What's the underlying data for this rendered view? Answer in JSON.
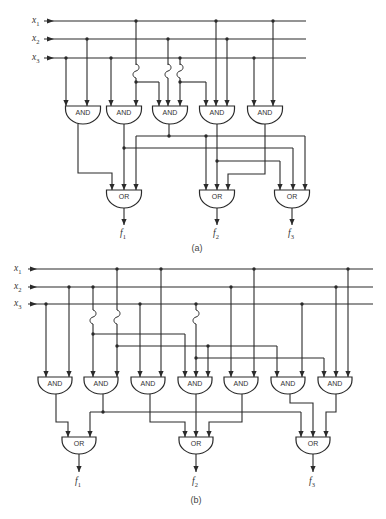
{
  "figure": {
    "panels": [
      {
        "id": "a",
        "caption": "(a)",
        "inputs": [
          {
            "name": "x",
            "sub": "1"
          },
          {
            "name": "x",
            "sub": "2"
          },
          {
            "name": "x",
            "sub": "3"
          }
        ],
        "and_gates": [
          {
            "label": "AND",
            "inputs": [
              "x3",
              "x2"
            ]
          },
          {
            "label": "AND",
            "inputs": [
              "x3",
              "x1"
            ]
          },
          {
            "label": "AND",
            "inputs": [
              "x1",
              "x2",
              "x3"
            ]
          },
          {
            "label": "AND",
            "inputs": [
              "x3",
              "x1",
              "x2"
            ]
          },
          {
            "label": "AND",
            "inputs": [
              "x3",
              "x1"
            ]
          }
        ],
        "or_gates": [
          {
            "label": "OR",
            "output": {
              "name": "f",
              "sub": "1"
            }
          },
          {
            "label": "OR",
            "output": {
              "name": "f",
              "sub": "2"
            }
          },
          {
            "label": "OR",
            "output": {
              "name": "f",
              "sub": "3"
            }
          }
        ]
      },
      {
        "id": "b",
        "caption": "(b)",
        "inputs": [
          {
            "name": "x",
            "sub": "1"
          },
          {
            "name": "x",
            "sub": "2"
          },
          {
            "name": "x",
            "sub": "3"
          }
        ],
        "and_gates": [
          {
            "label": "AND"
          },
          {
            "label": "AND"
          },
          {
            "label": "AND"
          },
          {
            "label": "AND"
          },
          {
            "label": "AND"
          },
          {
            "label": "AND"
          },
          {
            "label": "AND"
          }
        ],
        "or_gates": [
          {
            "label": "OR",
            "output": {
              "name": "f",
              "sub": "1"
            }
          },
          {
            "label": "OR",
            "output": {
              "name": "f",
              "sub": "2"
            }
          },
          {
            "label": "OR",
            "output": {
              "name": "f",
              "sub": "3"
            }
          }
        ]
      }
    ]
  },
  "colors": {
    "line": "#2a2a2a",
    "background": "#ffffff"
  }
}
